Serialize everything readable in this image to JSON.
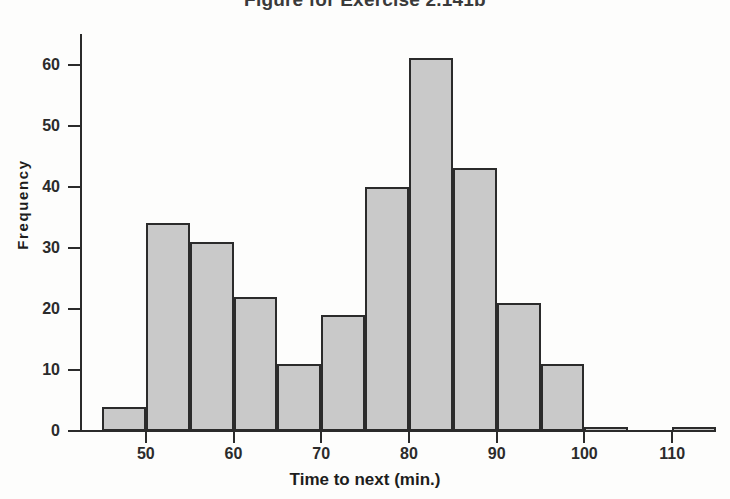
{
  "title": "Figure for Exercise 2.141b",
  "chart_data": {
    "type": "bar",
    "title": "Figure for Exercise 2.141b",
    "xlabel": "Time to next (min.)",
    "ylabel": "Frequency",
    "xlim": [
      42.5,
      115
    ],
    "ylim": [
      0,
      65
    ],
    "grid": false,
    "legend": null,
    "bin_width": 5,
    "bin_edges": [
      45,
      50,
      55,
      60,
      65,
      70,
      75,
      80,
      85,
      90,
      95,
      100,
      105,
      110
    ],
    "categories": [
      "45-50",
      "50-55",
      "55-60",
      "60-65",
      "65-70",
      "70-75",
      "75-80",
      "80-85",
      "85-90",
      "90-95",
      "95-100",
      "100-105",
      "105-110"
    ],
    "values": [
      4,
      34,
      31,
      22,
      11,
      19,
      40,
      61,
      43,
      21,
      11,
      0.7,
      0.7
    ],
    "x_ticks": [
      50,
      60,
      70,
      80,
      90,
      100,
      110
    ],
    "y_ticks": [
      0,
      10,
      20,
      30,
      40,
      50,
      60
    ],
    "bar_fill_color": "#c9c9c9",
    "bar_edge_color": "#2b2b2b",
    "bars": [
      {
        "label": "45-50",
        "left": 45,
        "right": 50,
        "value": 4
      },
      {
        "label": "50-55",
        "left": 50,
        "right": 55,
        "value": 34
      },
      {
        "label": "55-60",
        "left": 55,
        "right": 60,
        "value": 31
      },
      {
        "label": "60-65",
        "left": 60,
        "right": 65,
        "value": 22
      },
      {
        "label": "65-70",
        "left": 65,
        "right": 70,
        "value": 11
      },
      {
        "label": "70-75",
        "left": 70,
        "right": 75,
        "value": 19
      },
      {
        "label": "75-80",
        "left": 75,
        "right": 80,
        "value": 40
      },
      {
        "label": "80-85",
        "left": 80,
        "right": 85,
        "value": 61
      },
      {
        "label": "85-90",
        "left": 85,
        "right": 90,
        "value": 43
      },
      {
        "label": "90-95",
        "left": 90,
        "right": 95,
        "value": 21
      },
      {
        "label": "95-100",
        "left": 95,
        "right": 100,
        "value": 11
      },
      {
        "label": "100-105",
        "left": 100,
        "right": 105,
        "value": 0.7
      },
      {
        "label": "105-110",
        "left": 110,
        "right": 115,
        "value": 0.7
      }
    ]
  }
}
